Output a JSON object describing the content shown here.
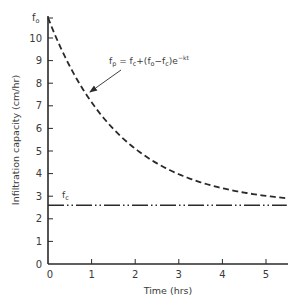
{
  "chart_data": {
    "type": "line",
    "title": "",
    "xlabel": "Time (hrs)",
    "ylabel": "Infiltration capacity (cm/hr)",
    "xlim": [
      0,
      5.5
    ],
    "ylim": [
      0,
      10.9
    ],
    "xticks": [
      0,
      1,
      2,
      3,
      4,
      5
    ],
    "yticks": [
      0,
      1,
      2,
      3,
      4,
      5,
      6,
      7,
      8,
      9,
      10
    ],
    "ytick_labels": [
      "0",
      "1",
      "2",
      "3",
      "4",
      "5",
      "6",
      "7",
      "8",
      "9",
      "10"
    ],
    "xtick_labels": [
      "0",
      "1",
      "2",
      "3",
      "4",
      "5"
    ],
    "grid": false,
    "legend": null,
    "series": [
      {
        "name": "f_p (Horton infiltration curve)",
        "style": "dashed",
        "x": [
          0,
          0.5,
          1,
          1.5,
          2,
          2.5,
          3,
          3.5,
          4,
          4.5,
          5,
          5.5
        ],
        "values": [
          10.9,
          8.7,
          7.1,
          5.9,
          4.9,
          4.2,
          3.7,
          3.3,
          3.0,
          2.8,
          2.7,
          2.6
        ]
      },
      {
        "name": "f_c (constant final infiltration capacity)",
        "style": "dash-dot-dot",
        "x": [
          0,
          5.5
        ],
        "values": [
          2.6,
          2.6
        ]
      }
    ],
    "annotations": [
      {
        "text": "f_o",
        "x": 0,
        "y": 10.9,
        "position": "y-axis label at top"
      },
      {
        "text": "f_c",
        "x": 0.35,
        "y": 2.6,
        "position": "above constant line"
      },
      {
        "text": "f_p = f_c+(f_o−f_c)e^(−kt)",
        "arrow_to": {
          "x": 0.94,
          "y": 7.6
        }
      }
    ],
    "params": {
      "f_o": 10.9,
      "f_c": 2.6,
      "k_approx": 0.6
    }
  },
  "labels": {
    "fo_main": "f",
    "fo_sub": "o",
    "fc_main": "f",
    "fc_sub": "c",
    "eq_fp": "f",
    "eq_fp_sub": "p",
    "eq_part1": " = f",
    "eq_c1": "c",
    "eq_part2": "+(f",
    "eq_o": "o",
    "eq_part3": "−f",
    "eq_c2": "c",
    "eq_part4": ")e",
    "eq_exp": "−kt",
    "xlabel": "Time (hrs)",
    "ylabel": "Infiltration capacity (cm/hr)"
  }
}
